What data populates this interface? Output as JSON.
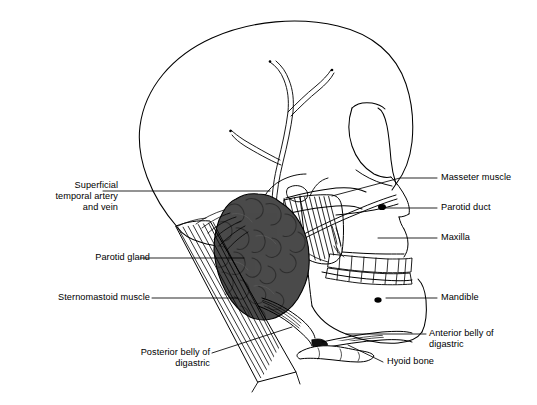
{
  "figure": {
    "type": "anatomical-line-diagram",
    "background_color": "#ffffff",
    "line_color": "#000000",
    "gland_fill_color": "#4a4a4a",
    "width": 537,
    "height": 405
  },
  "labels": [
    {
      "id": "superficial-temporal",
      "text": "Superficial\ntemporal artery\nand vein",
      "align": "right",
      "x": 8,
      "y": 180,
      "width": 110,
      "leader": "horizontal-to-temple"
    },
    {
      "id": "parotid-gland",
      "text": "Parotid gland",
      "align": "right",
      "x": 20,
      "y": 249,
      "width": 130,
      "leader": "horizontal-to-gland"
    },
    {
      "id": "sternomastoid-muscle",
      "text": "Sternomastoid muscle",
      "align": "right",
      "x": 10,
      "y": 293,
      "width": 140,
      "leader": "horizontal-to-muscle"
    },
    {
      "id": "posterior-belly-digastric",
      "text": "Posterior belly of\ndigastric",
      "align": "right",
      "x": 100,
      "y": 352,
      "width": 110,
      "leader": "diagonal-up-right"
    },
    {
      "id": "masseter-muscle",
      "text": "Masseter muscle",
      "align": "left",
      "x": 441,
      "y": 171,
      "width": 96,
      "leader": "horizontal-to-masseter"
    },
    {
      "id": "parotid-duct",
      "text": "Parotid duct",
      "align": "left",
      "x": 441,
      "y": 201,
      "width": 96,
      "leader": "horizontal-to-duct"
    },
    {
      "id": "maxilla",
      "text": "Maxilla",
      "align": "left",
      "x": 441,
      "y": 232,
      "width": 96,
      "leader": "horizontal-to-maxilla"
    },
    {
      "id": "mandible",
      "text": "Mandible",
      "align": "left",
      "x": 441,
      "y": 292,
      "width": 96,
      "leader": "horizontal-to-mandible"
    },
    {
      "id": "anterior-belly-digastric",
      "text": "Anterior belly of\ndigastric",
      "align": "left",
      "x": 429,
      "y": 327,
      "width": 105,
      "leader": "horizontal-to-anterior-digastric"
    },
    {
      "id": "hyoid-bone",
      "text": "Hyoid bone",
      "align": "left",
      "x": 387,
      "y": 358,
      "width": 90,
      "leader": "diagonal-up-left"
    }
  ],
  "structures": [
    {
      "id": "cranium",
      "name": "Cranial vault",
      "render": "outline"
    },
    {
      "id": "superficial-temporal-vessels",
      "name": "Superficial temporal artery and vein",
      "render": "branching-vessel"
    },
    {
      "id": "zygomatic-arch",
      "name": "Zygomatic arch",
      "render": "outline"
    },
    {
      "id": "orbit",
      "name": "Orbit",
      "render": "outline"
    },
    {
      "id": "nasal-aperture",
      "name": "Nasal aperture",
      "render": "outline"
    },
    {
      "id": "maxilla",
      "name": "Maxilla",
      "render": "outline"
    },
    {
      "id": "mandible",
      "name": "Mandible",
      "render": "outline"
    },
    {
      "id": "upper-teeth",
      "name": "Upper dental arch",
      "render": "teeth-row",
      "count": 8
    },
    {
      "id": "lower-teeth",
      "name": "Lower dental arch",
      "render": "teeth-row",
      "count": 8
    },
    {
      "id": "parotid-gland",
      "name": "Parotid gland",
      "render": "lobulated-mass",
      "fill": "#4a4a4a"
    },
    {
      "id": "parotid-duct",
      "name": "Parotid duct",
      "render": "duct-line"
    },
    {
      "id": "masseter-muscle",
      "name": "Masseter muscle",
      "render": "striated-hatching"
    },
    {
      "id": "sternomastoid-muscle",
      "name": "Sternomastoid muscle",
      "render": "striated-hatching"
    },
    {
      "id": "posterior-belly-digastric",
      "name": "Posterior belly of digastric",
      "render": "striated-band"
    },
    {
      "id": "anterior-belly-digastric",
      "name": "Anterior belly of digastric",
      "render": "striated-band"
    },
    {
      "id": "hyoid-bone",
      "name": "Hyoid bone",
      "render": "outline"
    },
    {
      "id": "external-acoustic-meatus",
      "name": "External acoustic meatus",
      "render": "outline"
    }
  ]
}
